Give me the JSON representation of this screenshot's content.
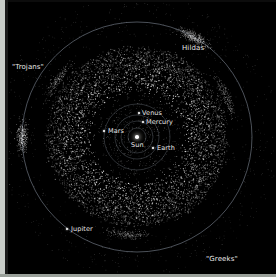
{
  "figure": {
    "background_color": "#000000",
    "orbit_color": "#8f9aa8",
    "asteroid_color": "#ffffff",
    "label_color": "#e8e8e8",
    "frame_color": "#c9cdc9"
  },
  "bodies": [
    {
      "name": "Sun",
      "label": "Sun",
      "x": 137,
      "y": 137,
      "label_x": 131,
      "label_y": 142,
      "kind": "star"
    },
    {
      "name": "Mercury",
      "label": "Mercury",
      "x": 143,
      "y": 122,
      "label_x": 146,
      "label_y": 119,
      "kind": "planet"
    },
    {
      "name": "Venus",
      "label": "Venus",
      "x": 139,
      "y": 113,
      "label_x": 142,
      "label_y": 110,
      "kind": "planet"
    },
    {
      "name": "Earth",
      "label": "Earth",
      "x": 153,
      "y": 148,
      "label_x": 157,
      "label_y": 145,
      "kind": "planet"
    },
    {
      "name": "Mars",
      "label": "Mars",
      "x": 104,
      "y": 131,
      "label_x": 108,
      "label_y": 128,
      "kind": "planet"
    },
    {
      "name": "Jupiter",
      "label": "Jupiter",
      "x": 67,
      "y": 229,
      "label_x": 71,
      "label_y": 226,
      "kind": "planet"
    }
  ],
  "annotations": [
    {
      "name": "trojans",
      "label": "\"Trojans\"",
      "x": 12,
      "y": 64
    },
    {
      "name": "hildas",
      "label": "Hildas",
      "x": 182,
      "y": 45
    },
    {
      "name": "greeks",
      "label": "\"Greeks\"",
      "x": 206,
      "y": 256
    }
  ],
  "chart_data": {
    "type": "scatter",
    "xlabel": "",
    "ylabel": "",
    "projection": "ecliptic plane, heliocentric",
    "center": {
      "x": 137,
      "y": 137
    },
    "orbits": [
      {
        "name": "Mercury",
        "radius_px": 9,
        "semimajor_au": 0.39
      },
      {
        "name": "Venus",
        "radius_px": 16,
        "semimajor_au": 0.72
      },
      {
        "name": "Earth",
        "radius_px": 22,
        "semimajor_au": 1.0
      },
      {
        "name": "Mars",
        "radius_px": 33,
        "semimajor_au": 1.52
      },
      {
        "name": "Jupiter",
        "radius_px": 115,
        "semimajor_au": 5.2
      }
    ],
    "populations": [
      {
        "name": "Main belt",
        "inner_radius_px": 45,
        "outer_radius_px": 90,
        "count": 5200,
        "description": "dense torus of main-belt asteroids between Mars and Jupiter"
      },
      {
        "name": "Hildas",
        "radius_px": 98,
        "count": 220,
        "description": "triangular Hilda group in 3:2 resonance with Jupiter"
      },
      {
        "name": "Greeks",
        "radius_px": 115,
        "angle_deg": 300,
        "count": 210,
        "description": "Jupiter L4 Trojan camp"
      },
      {
        "name": "Trojans",
        "radius_px": 115,
        "angle_deg": 180,
        "count": 200,
        "description": "Jupiter L5 Trojan camp"
      }
    ],
    "legend": [
      "Sun",
      "Mercury",
      "Venus",
      "Earth",
      "Mars",
      "Jupiter",
      "Hildas",
      "\"Greeks\"",
      "\"Trojans\""
    ],
    "grid": false
  }
}
